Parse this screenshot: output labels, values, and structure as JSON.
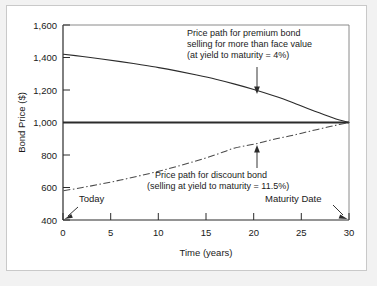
{
  "chart_data": {
    "type": "line",
    "title": "",
    "xlabel": "Time (years)",
    "ylabel": "Bond Price ($)",
    "xlim": [
      0,
      30
    ],
    "ylim": [
      400,
      1600
    ],
    "xticks": [
      "0",
      "5",
      "10",
      "15",
      "20",
      "25",
      "30"
    ],
    "xtick_values": [
      0,
      5,
      10,
      15,
      20,
      25,
      30
    ],
    "yticks": [
      "400",
      "600",
      "800",
      "1,000",
      "1,200",
      "1,400",
      "1,600"
    ],
    "ytick_values": [
      400,
      600,
      800,
      1000,
      1200,
      1400,
      1600
    ],
    "grid": false,
    "legend": "none",
    "reference_line": {
      "name": "face-value-line",
      "y": 1000,
      "label": "1,000"
    },
    "series": [
      {
        "name": "premium-bond-price-path",
        "style": "solid",
        "x": [
          0,
          2,
          4,
          6,
          8,
          10,
          12,
          14,
          16,
          18,
          20,
          22,
          24,
          26,
          28,
          29,
          30
        ],
        "y": [
          1420,
          1406,
          1391,
          1375,
          1357,
          1338,
          1316,
          1292,
          1266,
          1236,
          1203,
          1166,
          1125,
          1078,
          1035,
          1015,
          1000
        ]
      },
      {
        "name": "discount-bond-price-path",
        "style": "dash-dot",
        "x": [
          0,
          2,
          4,
          6,
          8,
          10,
          12,
          14,
          16,
          18,
          20,
          22,
          24,
          26,
          28,
          29,
          30
        ],
        "y": [
          580,
          600,
          622,
          646,
          672,
          700,
          731,
          765,
          802,
          843,
          866,
          895,
          920,
          948,
          975,
          988,
          1000
        ]
      }
    ],
    "annotations": [
      {
        "name": "premium-bond-annotation",
        "lines": [
          "Price path for premium bond",
          "selling for more than face value",
          "(at yield to maturity = 4%)"
        ],
        "arrow": "down",
        "points_to_x": 21,
        "points_to_y": 1205
      },
      {
        "name": "discount-bond-annotation",
        "lines": [
          "Price path for discount bond",
          "(selling at yield to maturity = 11.5%)"
        ],
        "arrow": "up",
        "points_to_x": 21,
        "points_to_y": 880
      },
      {
        "name": "today-marker",
        "lines": [
          "Today"
        ],
        "arrow": "down-left",
        "points_to_x": 0,
        "points_to_y": 400
      },
      {
        "name": "maturity-date-marker",
        "lines": [
          "Maturity Date"
        ],
        "arrow": "down-right",
        "points_to_x": 30,
        "points_to_y": 400
      }
    ]
  },
  "colors": {
    "curve": "#2b2b2b",
    "axis": "#2b2b2b",
    "text": "#1a1a1a",
    "frame_border": "#c9c9c9",
    "page_background": "#f2f2f2",
    "plot_background": "#ffffff"
  }
}
